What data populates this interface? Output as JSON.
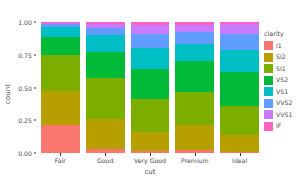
{
  "chart_data": {
    "type": "bar",
    "stacked": true,
    "position": "fill",
    "title": "",
    "xlabel": "cut",
    "ylabel": "count",
    "categories": [
      "Fair",
      "Good",
      "Very Good",
      "Premium",
      "Ideal"
    ],
    "ylim": [
      0,
      1
    ],
    "ytick_labels": [
      "0.00",
      "0.25",
      "0.50",
      "0.75",
      "1.00"
    ],
    "ytick_values": [
      0,
      0.25,
      0.5,
      0.75,
      1
    ],
    "grid": false,
    "legend_title": "clarity",
    "legend_position": "right",
    "series": [
      {
        "name": "I1",
        "color": "#F8766D",
        "values": [
          0.2144,
          0.03,
          0.0139,
          0.0204,
          0.0103
        ]
      },
      {
        "name": "SI2",
        "color": "#B79F00",
        "values": [
          0.261,
          0.232,
          0.15,
          0.193,
          0.126
        ]
      },
      {
        "name": "SI1",
        "color": "#619CFF00",
        "values": [
          0.274,
          0.314,
          0.249,
          0.25,
          0.224
        ]
      },
      {
        "name": "VS2",
        "color": "#00BA38",
        "values": [
          0.139,
          0.195,
          0.226,
          0.239,
          0.258
        ]
      },
      {
        "name": "VS1",
        "color": "#00BFC4",
        "values": [
          0.071,
          0.127,
          0.164,
          0.131,
          0.169
        ]
      },
      {
        "name": "VVS2",
        "color": "#619CFF",
        "values": [
          0.025,
          0.056,
          0.105,
          0.089,
          0.12
        ]
      },
      {
        "name": "VVS1",
        "color": "#C77CFF",
        "values": [
          0.011,
          0.032,
          0.068,
          0.052,
          0.075
        ]
      },
      {
        "name": "IF",
        "color": "#FF61C3",
        "values": [
          0.0046,
          0.014,
          0.0241,
          0.0256,
          0.0177
        ]
      }
    ]
  },
  "legend": {
    "title": "clarity",
    "items": [
      {
        "label": "I1",
        "color": "#F8766D"
      },
      {
        "label": "SI2",
        "color": "#B79F00"
      },
      {
        "label": "SI1",
        "color": "#7CAE00"
      },
      {
        "label": "VS2",
        "color": "#00BA38"
      },
      {
        "label": "VS1",
        "color": "#00BFC4"
      },
      {
        "label": "VVS2",
        "color": "#619CFF"
      },
      {
        "label": "VVS1",
        "color": "#C77CFF"
      },
      {
        "label": "IF",
        "color": "#FF61C3"
      }
    ]
  },
  "axes": {
    "y_title": "count",
    "x_title": "cut",
    "y_ticks": [
      "0.00",
      "0.25",
      "0.50",
      "0.75",
      "1.00"
    ],
    "x_ticks": [
      "Fair",
      "Good",
      "Very Good",
      "Premium",
      "Ideal"
    ]
  }
}
